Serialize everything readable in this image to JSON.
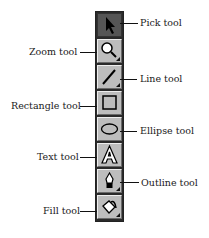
{
  "tools": [
    {
      "id": "pick",
      "label": "Pick tool",
      "icon": "arrow-pointer-icon",
      "side": "right",
      "flyout": false,
      "active": true
    },
    {
      "id": "zoom",
      "label": "Zoom tool",
      "icon": "magnifier-icon",
      "side": "left",
      "flyout": true,
      "active": false
    },
    {
      "id": "line",
      "label": "Line tool",
      "icon": "line-icon",
      "side": "right",
      "flyout": true,
      "active": false
    },
    {
      "id": "rectangle",
      "label": "Rectangle tool",
      "icon": "rectangle-icon",
      "side": "left",
      "flyout": false,
      "active": false
    },
    {
      "id": "ellipse",
      "label": "Ellipse tool",
      "icon": "ellipse-icon",
      "side": "right",
      "flyout": false,
      "active": false
    },
    {
      "id": "text",
      "label": "Text tool",
      "icon": "letter-a-icon",
      "side": "left",
      "flyout": false,
      "active": false
    },
    {
      "id": "outline",
      "label": "Outline tool",
      "icon": "pen-nib-icon",
      "side": "right",
      "flyout": true,
      "active": false
    },
    {
      "id": "fill",
      "label": "Fill tool",
      "icon": "paint-bucket-icon",
      "side": "left",
      "flyout": true,
      "active": false
    }
  ]
}
